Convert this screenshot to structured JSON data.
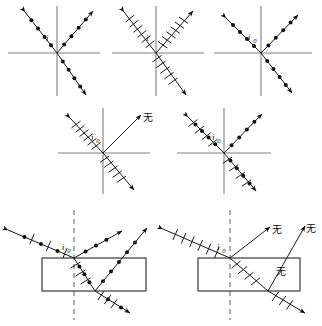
{
  "figure": {
    "symbols": {
      "dot_meaning": "component of E perpendicular to plane of incidence (dot)",
      "tick_meaning": "component of E parallel to plane of incidence (short stroke)",
      "none_label": "无",
      "none_label_meaning": "none / absent"
    },
    "colors": {
      "ray": "#1a1a1a",
      "axis": "#808080",
      "slab_border": "#555555",
      "normal_dash": "#777777",
      "background": "#ffffff"
    }
  },
  "panels": [
    {
      "id": "panel-1",
      "row": 1,
      "position": "top-left",
      "angle_label": "i",
      "angle_label_sub": "",
      "incident_marks": "dots",
      "reflected_marks": "dots",
      "refracted_marks": "dots",
      "has_slab": false,
      "has_normal_dash": false,
      "none_labels": []
    },
    {
      "id": "panel-2",
      "row": 1,
      "position": "top-middle",
      "angle_label": "i",
      "angle_label_sub": "",
      "incident_marks": "ticks",
      "reflected_marks": "ticks",
      "refracted_marks": "ticks",
      "has_slab": false,
      "has_normal_dash": false,
      "none_labels": []
    },
    {
      "id": "panel-3",
      "row": 1,
      "position": "top-right",
      "angle_label": "i",
      "angle_label_sub": "0",
      "incident_marks": "dots",
      "reflected_marks": "dots",
      "refracted_marks": "dots",
      "has_slab": false,
      "has_normal_dash": false,
      "none_labels": []
    },
    {
      "id": "panel-4",
      "row": 2,
      "position": "middle-left",
      "angle_label": "i",
      "angle_label_sub": "0",
      "incident_marks": "ticks",
      "reflected_marks": "none",
      "refracted_marks": "ticks",
      "has_slab": false,
      "has_normal_dash": false,
      "none_labels": [
        "无"
      ]
    },
    {
      "id": "panel-5",
      "row": 2,
      "position": "middle-right",
      "angle_label": "i",
      "angle_label_sub": "0",
      "incident_marks": "mixed",
      "reflected_marks": "dots",
      "refracted_marks": "mixed",
      "has_slab": false,
      "has_normal_dash": false,
      "none_labels": []
    },
    {
      "id": "panel-6",
      "row": 3,
      "position": "bottom-left",
      "angle_label": "i",
      "angle_label_sub": "0",
      "incident_marks": "mixed",
      "reflected_marks": "dots",
      "refracted_marks": "mixed",
      "second_reflected_marks": "dots",
      "exit_marks": "mixed",
      "has_slab": true,
      "has_normal_dash": true,
      "none_labels": []
    },
    {
      "id": "panel-7",
      "row": 3,
      "position": "bottom-right",
      "angle_label": "i",
      "angle_label_sub": "0",
      "incident_marks": "ticks",
      "reflected_marks": "none",
      "refracted_marks": "ticks",
      "second_reflected_marks": "none",
      "exit_marks": "ticks",
      "has_slab": true,
      "has_normal_dash": true,
      "none_labels": [
        "无",
        "无",
        "无"
      ]
    }
  ],
  "labels": {
    "p1_angle": "i",
    "p2_angle": "i",
    "p3_angle": "i",
    "p3_sub": "0",
    "p4_angle": "i",
    "p4_sub": "0",
    "p4_none": "无",
    "p5_angle": "i",
    "p5_sub": "0",
    "p6_angle": "i",
    "p6_sub": "0",
    "p7_angle": "i",
    "p7_sub": "0",
    "p7_none_1": "无",
    "p7_none_2": "无",
    "p7_none_3": "无"
  }
}
